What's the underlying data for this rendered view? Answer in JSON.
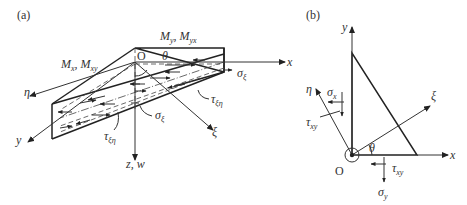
{
  "panel_a": {
    "label": "(a)",
    "axes": {
      "x": "x",
      "y": "y",
      "z": "z, w",
      "eta": "η",
      "xi": "ξ"
    },
    "origin": "O",
    "angle": "θ",
    "moments_top": {
      "main": "M",
      "s1": "y",
      "sep": ", M",
      "s2": "yx"
    },
    "moments_left": {
      "main": "M",
      "s1": "x",
      "sep": ", M",
      "s2": "xy"
    },
    "sigma_xi": {
      "main": "σ",
      "sub": "ξ"
    },
    "tau_xieta_right": {
      "main": "τ",
      "sub": "ξη"
    },
    "tau_xieta_bottom": {
      "main": "τ",
      "sub": "ξη"
    },
    "sigma_xi_bottom": {
      "main": "σ",
      "sub": "ξ"
    }
  },
  "panel_b": {
    "label": "(b)",
    "axes": {
      "x": "x",
      "y": "y",
      "eta": "η",
      "xi": "ξ"
    },
    "origin": "O",
    "angle": "θ",
    "sigma_x": {
      "main": "σ",
      "sub": "x"
    },
    "tau_xy_left": {
      "main": "τ",
      "sub": "xy"
    },
    "tau_xy_bottom": {
      "main": "τ",
      "sub": "xy"
    },
    "sigma_y": {
      "main": "σ",
      "sub": "y"
    }
  }
}
